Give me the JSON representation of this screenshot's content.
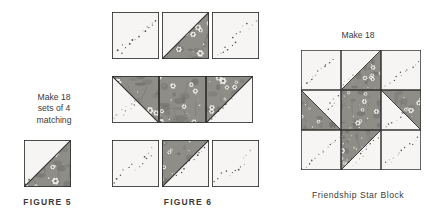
{
  "figure5": {
    "note_lines": [
      "Make 18",
      "sets of 4",
      "matching"
    ],
    "caption": "FIGURE 5",
    "unit": {
      "name": "half-square-triangle-unit",
      "light_position": "upper-left",
      "floral_position": "lower-right",
      "diagonal": "top-right-to-bottom-left"
    }
  },
  "figure6": {
    "caption": "FIGURE 6",
    "description": "Friendship Star block exploded into three rows of three units",
    "rows": [
      {
        "name": "top-row",
        "cells": [
          {
            "type": "light",
            "name": "light-square"
          },
          {
            "type": "hst",
            "name": "hst-floral-lower-right",
            "floral": "lower-right",
            "diagonal": "tr-bl"
          },
          {
            "type": "light",
            "name": "light-square"
          }
        ]
      },
      {
        "name": "middle-row",
        "cells": [
          {
            "type": "hst",
            "name": "hst-floral-upper-right",
            "floral": "upper-right",
            "diagonal": "tl-br"
          },
          {
            "type": "floral",
            "name": "floral-center-square"
          },
          {
            "type": "hst",
            "name": "hst-floral-upper-left",
            "floral": "upper-left",
            "diagonal": "tr-bl"
          }
        ]
      },
      {
        "name": "bottom-row",
        "cells": [
          {
            "type": "light",
            "name": "light-square"
          },
          {
            "type": "hst",
            "name": "hst-floral-upper-left",
            "floral": "upper-left",
            "diagonal": "bl-tr"
          },
          {
            "type": "light",
            "name": "light-square"
          }
        ]
      }
    ]
  },
  "star_block": {
    "note": "Make 18",
    "label": "Friendship Star Block",
    "layout": "3x3 nine-patch pinwheel star",
    "cells": [
      {
        "type": "light",
        "name": "corner-top-left"
      },
      {
        "type": "hst",
        "name": "star-point-top",
        "floral": "lower-right",
        "diagonal": "tr-bl"
      },
      {
        "type": "light",
        "name": "corner-top-right"
      },
      {
        "type": "hst",
        "name": "star-point-left",
        "floral": "lower-left",
        "diagonal": "tl-br"
      },
      {
        "type": "floral",
        "name": "center-square"
      },
      {
        "type": "hst",
        "name": "star-point-right",
        "floral": "upper-right",
        "diagonal": "tl-br"
      },
      {
        "type": "light",
        "name": "corner-bottom-left"
      },
      {
        "type": "hst",
        "name": "star-point-bottom",
        "floral": "upper-left",
        "diagonal": "bl-tr"
      },
      {
        "type": "light",
        "name": "corner-bottom-right"
      }
    ]
  },
  "colors": {
    "light_fabric": "#f6f5f3",
    "light_dot": "#555450",
    "light_dot_pale": "#b9b8b4",
    "floral_fabric": "#8e8d88",
    "floral_dark": "#6f6e69",
    "floral_flower": "#f2f1ee",
    "seam_line": "#2e2e2c",
    "text": "#3a3a3a"
  }
}
